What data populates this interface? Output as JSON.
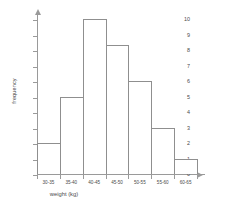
{
  "chart_data": {
    "type": "bar",
    "title": "",
    "subtitle": "",
    "xlabel": "weight (kg)",
    "ylabel": "frequency",
    "categories": [
      "30-35",
      "35-40",
      "40-45",
      "45-50",
      "50-55",
      "55-60",
      "60-65"
    ],
    "values": [
      2,
      5,
      10,
      8.3,
      6,
      3,
      1
    ],
    "ylim": [
      0,
      10
    ],
    "ytick_labels": [
      "0",
      "1",
      "2",
      "3",
      "4",
      "5",
      "6",
      "7",
      "8",
      "9",
      "10"
    ],
    "grid": false,
    "legend": null,
    "annotations": [],
    "style": {
      "bar_fill": "#ffffff",
      "bar_edge": "#8f8f8f",
      "axis_color": "#9a9a9a",
      "text_color": "#4a4a4a",
      "background": "#ffffff"
    }
  }
}
